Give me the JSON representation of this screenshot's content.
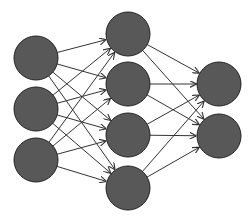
{
  "diagram": {
    "type": "neural-network",
    "node_fill": "#585858",
    "node_stroke": "#222222",
    "edge_color": "#333333",
    "node_radius": 22,
    "layers": [
      {
        "name": "input",
        "x": 36,
        "nodes_y": [
          58,
          109,
          160
        ]
      },
      {
        "name": "hidden",
        "x": 128,
        "nodes_y": [
          34,
          84,
          135,
          188
        ]
      },
      {
        "name": "output",
        "x": 219,
        "nodes_y": [
          84,
          136
        ]
      }
    ],
    "connectivity": "fully-connected",
    "edges_directed": true
  }
}
